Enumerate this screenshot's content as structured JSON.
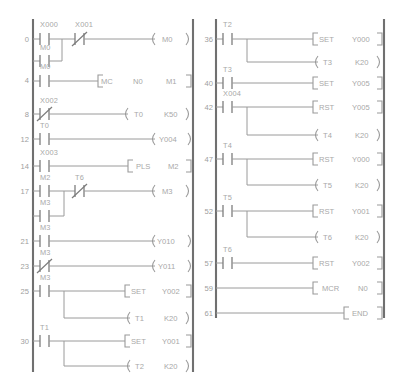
{
  "diagram": {
    "type": "ladder-diagram",
    "colors": {
      "rail": "#707070",
      "wire": "#9a9a9a",
      "text": "#a8a8a8",
      "background": "#ffffff"
    },
    "columns": [
      {
        "name": "left-column",
        "rungs": [
          {
            "step": "0",
            "branches": [
              {
                "contacts": [
                  {
                    "label": "X000",
                    "type": "NO"
                  },
                  {
                    "label": "X001",
                    "type": "NC"
                  }
                ]
              },
              {
                "contacts": [
                  {
                    "label": "M0",
                    "type": "NO"
                  }
                ]
              }
            ],
            "outputs": [
              {
                "kind": "coil",
                "instruction": "",
                "operand": "M0",
                "preset": ""
              }
            ]
          },
          {
            "step": "4",
            "branches": [
              {
                "contacts": [
                  {
                    "label": "M0",
                    "type": "NO"
                  }
                ]
              }
            ],
            "outputs": [
              {
                "kind": "box",
                "instruction": "MC",
                "operand": "N0",
                "preset": "M1"
              }
            ]
          },
          {
            "step": "8",
            "branches": [
              {
                "contacts": [
                  {
                    "label": "X002",
                    "type": "NC"
                  }
                ]
              }
            ],
            "outputs": [
              {
                "kind": "coil",
                "instruction": "",
                "operand": "T0",
                "preset": "K50"
              }
            ]
          },
          {
            "step": "12",
            "branches": [
              {
                "contacts": [
                  {
                    "label": "T0",
                    "type": "NO"
                  }
                ]
              }
            ],
            "outputs": [
              {
                "kind": "coil",
                "instruction": "",
                "operand": "Y004",
                "preset": ""
              }
            ]
          },
          {
            "step": "14",
            "branches": [
              {
                "contacts": [
                  {
                    "label": "X003",
                    "type": "NO"
                  }
                ]
              }
            ],
            "outputs": [
              {
                "kind": "box",
                "instruction": "PLS",
                "operand": "M2",
                "preset": ""
              }
            ]
          },
          {
            "step": "17",
            "branches": [
              {
                "contacts": [
                  {
                    "label": "M2",
                    "type": "NO"
                  },
                  {
                    "label": "T6",
                    "type": "NC"
                  }
                ]
              },
              {
                "contacts": [
                  {
                    "label": "M3",
                    "type": "NO"
                  }
                ]
              }
            ],
            "outputs": [
              {
                "kind": "coil",
                "instruction": "",
                "operand": "M3",
                "preset": ""
              }
            ]
          },
          {
            "step": "21",
            "branches": [
              {
                "contacts": [
                  {
                    "label": "M3",
                    "type": "NO"
                  }
                ]
              }
            ],
            "outputs": [
              {
                "kind": "coil",
                "instruction": "",
                "operand": "Y010",
                "preset": ""
              }
            ]
          },
          {
            "step": "23",
            "branches": [
              {
                "contacts": [
                  {
                    "label": "M3",
                    "type": "NC"
                  }
                ]
              }
            ],
            "outputs": [
              {
                "kind": "coil",
                "instruction": "",
                "operand": "Y011",
                "preset": ""
              }
            ]
          },
          {
            "step": "25",
            "branches": [
              {
                "contacts": [
                  {
                    "label": "M3",
                    "type": "NO"
                  }
                ]
              }
            ],
            "outputs": [
              {
                "kind": "box",
                "instruction": "SET",
                "operand": "Y002",
                "preset": ""
              },
              {
                "kind": "coil",
                "instruction": "",
                "operand": "T1",
                "preset": "K20"
              }
            ]
          },
          {
            "step": "30",
            "branches": [
              {
                "contacts": [
                  {
                    "label": "T1",
                    "type": "NO"
                  }
                ]
              }
            ],
            "outputs": [
              {
                "kind": "box",
                "instruction": "SET",
                "operand": "Y001",
                "preset": ""
              },
              {
                "kind": "coil",
                "instruction": "",
                "operand": "T2",
                "preset": "K20"
              }
            ]
          }
        ]
      },
      {
        "name": "right-column",
        "rungs": [
          {
            "step": "36",
            "branches": [
              {
                "contacts": [
                  {
                    "label": "T2",
                    "type": "NO"
                  }
                ]
              }
            ],
            "outputs": [
              {
                "kind": "box",
                "instruction": "SET",
                "operand": "Y000",
                "preset": ""
              },
              {
                "kind": "coil",
                "instruction": "",
                "operand": "T3",
                "preset": "K20"
              }
            ]
          },
          {
            "step": "40",
            "branches": [
              {
                "contacts": [
                  {
                    "label": "T3",
                    "type": "NO"
                  }
                ]
              }
            ],
            "outputs": [
              {
                "kind": "box",
                "instruction": "SET",
                "operand": "Y005",
                "preset": ""
              }
            ]
          },
          {
            "step": "42",
            "branches": [
              {
                "contacts": [
                  {
                    "label": "X004",
                    "type": "NO"
                  }
                ]
              }
            ],
            "outputs": [
              {
                "kind": "box",
                "instruction": "RST",
                "operand": "Y005",
                "preset": ""
              },
              {
                "kind": "coil",
                "instruction": "",
                "operand": "T4",
                "preset": "K20"
              }
            ]
          },
          {
            "step": "47",
            "branches": [
              {
                "contacts": [
                  {
                    "label": "T4",
                    "type": "NO"
                  }
                ]
              }
            ],
            "outputs": [
              {
                "kind": "box",
                "instruction": "RST",
                "operand": "Y000",
                "preset": ""
              },
              {
                "kind": "coil",
                "instruction": "",
                "operand": "T5",
                "preset": "K20"
              }
            ]
          },
          {
            "step": "52",
            "branches": [
              {
                "contacts": [
                  {
                    "label": "T5",
                    "type": "NO"
                  }
                ]
              }
            ],
            "outputs": [
              {
                "kind": "box",
                "instruction": "RST",
                "operand": "Y001",
                "preset": ""
              },
              {
                "kind": "coil",
                "instruction": "",
                "operand": "T6",
                "preset": "K20"
              }
            ]
          },
          {
            "step": "57",
            "branches": [
              {
                "contacts": [
                  {
                    "label": "T6",
                    "type": "NO"
                  }
                ]
              }
            ],
            "outputs": [
              {
                "kind": "box",
                "instruction": "RST",
                "operand": "Y002",
                "preset": ""
              }
            ]
          },
          {
            "step": "59",
            "branches": [],
            "outputs": [
              {
                "kind": "box",
                "instruction": "MCR",
                "operand": "N0",
                "preset": ""
              }
            ]
          },
          {
            "step": "61",
            "branches": [],
            "outputs": [
              {
                "kind": "box",
                "instruction": "END",
                "operand": "",
                "preset": ""
              }
            ]
          }
        ]
      }
    ]
  },
  "labels": {
    "L0_step": "0",
    "L0_c1": "X000",
    "L0_c2": "X001",
    "L0_b1": "M0",
    "L0_out": "M0",
    "L4_step": "4",
    "L4_c1": "M0",
    "L4_inst": "MC",
    "L4_op": "N0",
    "L4_op2": "M1",
    "L8_step": "8",
    "L8_c1": "X002",
    "L8_out": "T0",
    "L8_k": "K50",
    "L12_step": "12",
    "L12_c1": "T0",
    "L12_out": "Y004",
    "L14_step": "14",
    "L14_c1": "X003",
    "L14_inst": "PLS",
    "L14_op": "M2",
    "L17_step": "17",
    "L17_c1": "M2",
    "L17_c2": "T6",
    "L17_b1": "M3",
    "L17_out": "M3",
    "L21_step": "21",
    "L21_c1": "M3",
    "L21_out": "Y010",
    "L23_step": "23",
    "L23_c1": "M3",
    "L23_out": "Y011",
    "L25_step": "25",
    "L25_c1": "M3",
    "L25_inst": "SET",
    "L25_op": "Y002",
    "L25_out2": "T1",
    "L25_k": "K20",
    "L30_step": "30",
    "L30_c1": "T1",
    "L30_inst": "SET",
    "L30_op": "Y001",
    "L30_out2": "T2",
    "L30_k": "K20",
    "R36_step": "36",
    "R36_c1": "T2",
    "R36_inst": "SET",
    "R36_op": "Y000",
    "R36_out2": "T3",
    "R36_k": "K20",
    "R40_step": "40",
    "R40_c1": "T3",
    "R40_inst": "SET",
    "R40_op": "Y005",
    "R42_step": "42",
    "R42_c1": "X004",
    "R42_inst": "RST",
    "R42_op": "Y005",
    "R42_out2": "T4",
    "R42_k": "K20",
    "R47_step": "47",
    "R47_c1": "T4",
    "R47_inst": "RST",
    "R47_op": "Y000",
    "R47_out2": "T5",
    "R47_k": "K20",
    "R52_step": "52",
    "R52_c1": "T5",
    "R52_inst": "RST",
    "R52_op": "Y001",
    "R52_out2": "T6",
    "R52_k": "K20",
    "R57_step": "57",
    "R57_c1": "T6",
    "R57_inst": "RST",
    "R57_op": "Y002",
    "R59_step": "59",
    "R59_inst": "MCR",
    "R59_op": "N0",
    "R61_step": "61",
    "R61_inst": "END"
  }
}
